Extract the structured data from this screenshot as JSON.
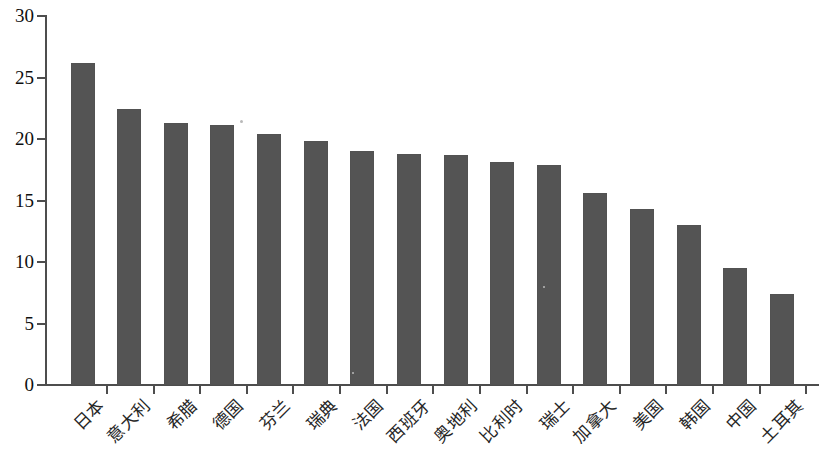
{
  "chart_data": {
    "type": "bar",
    "title": "",
    "subtitle": "",
    "xlabel": "",
    "ylabel": "",
    "ylim": [
      0,
      30
    ],
    "ytick_values": [
      0,
      5,
      10,
      15,
      20,
      25,
      30
    ],
    "ytick_labels": [
      "0",
      "5",
      "10",
      "15",
      "20",
      "25",
      "30"
    ],
    "grid": false,
    "legend": null,
    "bar_color": "#545454",
    "axis_color": "#4d4d4d",
    "categories": [
      "日本",
      "意大利",
      "希腊",
      "德国",
      "芬兰",
      "瑞典",
      "法国",
      "西班牙",
      "奥地利",
      "比利时",
      "瑞士",
      "加拿大",
      "美国",
      "韩国",
      "中国",
      "土耳其"
    ],
    "values": [
      26.2,
      22.4,
      21.3,
      21.1,
      20.4,
      19.8,
      19.0,
      18.8,
      18.7,
      18.1,
      17.9,
      15.6,
      14.3,
      13.0,
      9.5,
      7.4
    ]
  }
}
